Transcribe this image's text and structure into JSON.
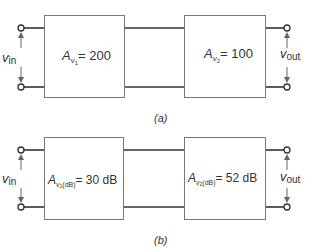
{
  "diagram_a": {
    "caption": "(a)",
    "stage1": {
      "symbol": "A",
      "sub": "v",
      "subsub": "1",
      "dbsub": "",
      "value": "= 200"
    },
    "stage2": {
      "symbol": "A",
      "sub": "v",
      "subsub": "2",
      "dbsub": "",
      "value": "= 100"
    },
    "input_label": {
      "main": "v",
      "sub": "in"
    },
    "output_label": {
      "main": "v",
      "sub": "out"
    }
  },
  "diagram_b": {
    "caption": "(b)",
    "stage1": {
      "symbol": "A",
      "sub": "v",
      "subsub": "1",
      "dbsub": "(dB)",
      "value": "= 30 dB"
    },
    "stage2": {
      "symbol": "A",
      "sub": "v",
      "subsub": "2",
      "dbsub": "(dB)",
      "value": "= 52 dB"
    },
    "input_label": {
      "main": "v",
      "sub": "in"
    },
    "output_label": {
      "main": "v",
      "sub": "out"
    }
  },
  "colors": {
    "line": "#555555",
    "box": "#777777",
    "wire": "#333333",
    "text": "#333333"
  }
}
